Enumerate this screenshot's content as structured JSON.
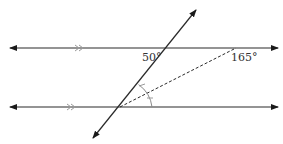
{
  "diagram": {
    "type": "geometry-parallel-lines-transversal",
    "colors": {
      "line": "#2a2a2a",
      "parallel_mark": "#9a9a9a",
      "angle_arc": "#8a8a8a",
      "label": "#333333",
      "background": "#ffffff"
    },
    "lines": [
      {
        "id": "top-parallel-line",
        "x1": 10,
        "y1": 48,
        "x2": 278,
        "y2": 48,
        "arrows": "both",
        "parallel_mark": ">>",
        "mark_x": 78
      },
      {
        "id": "bottom-parallel-line",
        "x1": 10,
        "y1": 107,
        "x2": 278,
        "y2": 107,
        "arrows": "both",
        "parallel_mark": ">>",
        "mark_x": 70
      },
      {
        "id": "transversal",
        "x1": 93,
        "y1": 138,
        "x2": 196,
        "y2": 10,
        "arrows": "both"
      },
      {
        "id": "dashed-ray",
        "x1": 120,
        "y1": 107,
        "x2": 236,
        "y2": 48,
        "style": "dashed"
      }
    ],
    "labels": {
      "angle_top_left": "50°",
      "angle_top_right": "165°"
    },
    "bisector_marks": "angle at bottom intersection split into two equal parts (tick marks on arc)"
  }
}
